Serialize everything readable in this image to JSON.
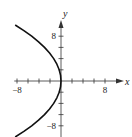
{
  "chart_data": {
    "type": "line",
    "title": "",
    "xlabel": "x",
    "ylabel": "y",
    "xlim": [
      -8.5,
      9
    ],
    "ylim": [
      -10,
      10
    ],
    "x_tick_step": 2,
    "y_tick_step": 2,
    "x_tick_labels": [
      {
        "value": -8,
        "text": "−8"
      },
      {
        "value": 8,
        "text": "8"
      }
    ],
    "y_tick_labels": [
      {
        "value": 8,
        "text": "8"
      },
      {
        "value": -8,
        "text": "−8"
      }
    ],
    "grid": false,
    "series": [
      {
        "name": "x = -y^2/12",
        "color": "#111111",
        "points": [
          [
            -8.33,
            10
          ],
          [
            -6.75,
            9
          ],
          [
            -5.33,
            8
          ],
          [
            -4.08,
            7
          ],
          [
            -3.0,
            6
          ],
          [
            -2.08,
            5
          ],
          [
            -1.33,
            4
          ],
          [
            -0.75,
            3
          ],
          [
            -0.33,
            2
          ],
          [
            -0.08,
            1
          ],
          [
            0,
            0
          ],
          [
            -0.08,
            -1
          ],
          [
            -0.33,
            -2
          ],
          [
            -0.75,
            -3
          ],
          [
            -1.33,
            -4
          ],
          [
            -2.08,
            -5
          ],
          [
            -3.0,
            -6
          ],
          [
            -4.08,
            -7
          ],
          [
            -5.33,
            -8
          ],
          [
            -6.75,
            -9
          ],
          [
            -8.33,
            -10
          ]
        ]
      }
    ]
  }
}
